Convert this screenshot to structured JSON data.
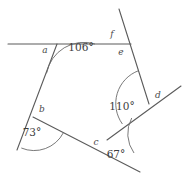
{
  "diagram": {
    "stroke_color": "#5b5b5b",
    "arc_color": "#6a6a6a",
    "text_color": "#3d3d3d",
    "background": "#ffffff",
    "known_angles": [
      {
        "id": "angle-106",
        "label": "106°",
        "value": 106,
        "x": 81,
        "y": 51
      },
      {
        "id": "angle-110",
        "label": "110°",
        "value": 110,
        "x": 122,
        "y": 110
      },
      {
        "id": "angle-73",
        "label": "73°",
        "value": 73,
        "x": 32,
        "y": 136
      },
      {
        "id": "angle-67",
        "label": "67°",
        "value": 67,
        "x": 116,
        "y": 158
      }
    ],
    "unknown_angles": [
      {
        "id": "angle-a",
        "label": "a",
        "x": 45,
        "y": 53
      },
      {
        "id": "angle-b",
        "label": "b",
        "x": 42,
        "y": 112
      },
      {
        "id": "angle-c",
        "label": "c",
        "x": 96,
        "y": 145
      },
      {
        "id": "angle-d",
        "label": "d",
        "x": 158,
        "y": 98
      },
      {
        "id": "angle-e",
        "label": "e",
        "x": 121,
        "y": 55
      },
      {
        "id": "angle-f",
        "label": "f",
        "x": 112,
        "y": 37
      }
    ],
    "vertices": [
      {
        "id": "vertex-top-left",
        "x": 57,
        "y": 44
      },
      {
        "id": "vertex-top-right",
        "x": 131,
        "y": 44
      },
      {
        "id": "vertex-right",
        "x": 149,
        "y": 104
      },
      {
        "id": "vertex-bottom",
        "x": 107,
        "y": 140
      },
      {
        "id": "vertex-left",
        "x": 33,
        "y": 117
      }
    ],
    "segments": [
      {
        "id": "segment-horizontal-top",
        "x1": 8,
        "y1": 44,
        "x2": 131,
        "y2": 44
      },
      {
        "id": "segment-top-left-to-left",
        "x1": 57,
        "y1": 44,
        "x2": 17,
        "y2": 150
      },
      {
        "id": "segment-left-to-bottom",
        "x1": 33,
        "y1": 117,
        "x2": 140,
        "y2": 172
      },
      {
        "id": "segment-bottom-to-right",
        "x1": 107,
        "y1": 140,
        "x2": 181,
        "y2": 86
      },
      {
        "id": "segment-right-to-top-right",
        "x1": 149,
        "y1": 104,
        "x2": 119,
        "y2": 9
      }
    ]
  }
}
